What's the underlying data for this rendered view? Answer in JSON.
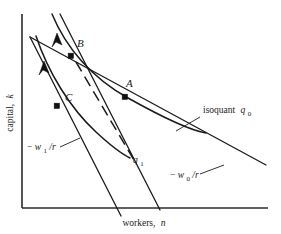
{
  "figure": {
    "kind": "isoquant-isocost-diagram",
    "background_color": "#ffffff",
    "ink_color": "#1a1a1a"
  },
  "axes": {
    "y_label_text": "capital,",
    "y_label_symbol": "k",
    "x_label_text": "workers,",
    "x_label_symbol": "n",
    "origin": {
      "x": 22,
      "y": 208
    },
    "x_axis_end": {
      "x": 268,
      "y": 208
    },
    "y_axis_top": {
      "x": 22,
      "y": 14
    }
  },
  "points": [
    {
      "label": "A",
      "label_x": 126,
      "label_y": 87,
      "marker_x": 125,
      "marker_y": 97,
      "description": "tangency of original isocost and isoquant q0"
    },
    {
      "label": "B",
      "label_x": 77,
      "label_y": 47,
      "marker_x": 71,
      "marker_y": 56,
      "description": "tangency of new steeper isocost and isoquant q0"
    },
    {
      "label": "C",
      "label_x": 65,
      "label_y": 101,
      "marker_x": 57,
      "marker_y": 106,
      "description": "tangency of new isocost and lower isoquant q1"
    }
  ],
  "curves": [
    {
      "name": "isoquant-q0",
      "label": "isoquant",
      "label_symbol": "q",
      "label_subscript": "0",
      "label_x": 203,
      "label_y": 113,
      "leader_from": {
        "x": 200,
        "y": 117
      },
      "leader_to": {
        "x": 176,
        "y": 131
      }
    },
    {
      "name": "isoquant-q1",
      "label_symbol": "q",
      "label_subscript": "1",
      "label_x": 133,
      "label_y": 163
    },
    {
      "name": "isocost-w0",
      "label_prefix": "−",
      "label_symbol": "w",
      "label_subscript": "0",
      "label_suffix": "/r",
      "label_x": 170,
      "label_y": 178,
      "leader_from": {
        "x": 200,
        "y": 174
      },
      "leader_to": {
        "x": 224,
        "y": 165
      }
    },
    {
      "name": "isocost-w1",
      "label_prefix": "−",
      "label_symbol": "w",
      "label_subscript": "1",
      "label_suffix": "/r",
      "label_x": 27,
      "label_y": 150,
      "leader_from": {
        "x": 60,
        "y": 147
      },
      "leader_to": {
        "x": 80,
        "y": 138
      }
    }
  ],
  "geometry": {
    "isoquant_q0_path": "M 52 14 C 66 48, 92 78, 128 98 C 162 117, 188 130, 206 133",
    "isoquant_q1_path": "M 36 36 C 48 72, 70 108, 96 132 C 110 145, 122 154, 130 158",
    "isocost_w0_path": "M 30 37 L 266 165",
    "isocost_w1_upper_path": "M 60 14 L 160 210",
    "isocost_w1_lower_path": "M 30 37 L 121 216",
    "expansion_path": "M 76 62 L 134 160",
    "arrow_upper": {
      "x": 57,
      "y": 39,
      "angle": 63
    },
    "arrow_lower": {
      "x": 44,
      "y": 67,
      "angle": 63
    }
  }
}
